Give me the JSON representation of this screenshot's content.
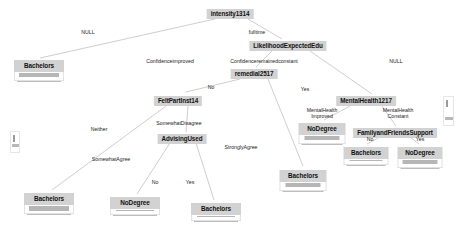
{
  "plot": {
    "type": "decision-tree",
    "background": "#ffffff",
    "node_fill": "#d2d2d2",
    "bar_fill": "#b6b6b6",
    "edge_color": "#b9b9b9",
    "width": 464,
    "height": 241
  },
  "nodes": [
    {
      "id": "intensity1314",
      "label": "intensity1314",
      "x": 230,
      "y": 9,
      "kind": "inner"
    },
    {
      "id": "LikelihoodExpectedEdu",
      "label": "LikelihoodExpectedEdu",
      "x": 288,
      "y": 41,
      "kind": "inner"
    },
    {
      "id": "remedial2517",
      "label": "remedial2517",
      "x": 254,
      "y": 69,
      "kind": "inner"
    },
    {
      "id": "FeltPartInst14",
      "label": "FeltPartInst14",
      "x": 178,
      "y": 96,
      "kind": "inner"
    },
    {
      "id": "MentalHealth1217",
      "label": "MentalHealth1217",
      "x": 366,
      "y": 96,
      "kind": "inner"
    },
    {
      "id": "AdvisingUsed",
      "label": "AdvisingUsed",
      "x": 182,
      "y": 134,
      "kind": "inner"
    },
    {
      "id": "FamilyandFriendsSupport",
      "label": "FamilyandFriendsSupport",
      "x": 395,
      "y": 128,
      "kind": "inner"
    }
  ],
  "leaves": [
    {
      "id": "leaf-bachelors-1",
      "label": "Bachelors",
      "x": 39,
      "y": 60,
      "width": 50,
      "bar_height": 4.4,
      "bar_width": 0.95
    },
    {
      "id": "leaf-nodegree-1",
      "label": "NoDegree",
      "x": 322,
      "y": 123,
      "width": 47,
      "bar_height": 4.4,
      "bar_width": 0.92
    },
    {
      "id": "leaf-bachelors-2",
      "label": "Bachelors",
      "x": 366,
      "y": 147,
      "width": 45,
      "bar_height": 1.2,
      "bar_width": 0.9
    },
    {
      "id": "leaf-nodegree-2",
      "label": "NoDegree",
      "x": 420,
      "y": 147,
      "width": 45,
      "bar_height": 4.4,
      "bar_width": 0.92
    },
    {
      "id": "leaf-bachelors-3",
      "label": "Bachelors",
      "x": 49,
      "y": 193,
      "width": 50,
      "bar_height": 4.6,
      "bar_width": 0.94
    },
    {
      "id": "leaf-nodegree-3",
      "label": "NoDegree",
      "x": 135,
      "y": 197,
      "width": 50,
      "bar_height": 1.2,
      "bar_width": 0.92
    },
    {
      "id": "leaf-bachelors-4",
      "label": "Bachelors",
      "x": 216,
      "y": 203,
      "width": 50,
      "bar_height": 1.2,
      "bar_width": 0.92
    },
    {
      "id": "leaf-bachelors-5",
      "label": "Bachelors",
      "x": 303,
      "y": 170,
      "width": 47,
      "bar_height": 4.4,
      "bar_width": 0.92
    }
  ],
  "edge_labels": [
    {
      "id": "edge-null-left",
      "text": "NULL",
      "x": 88,
      "y": 33
    },
    {
      "id": "edge-fulltime",
      "text": "fulltime",
      "x": 257,
      "y": 33
    },
    {
      "id": "edge-conf-improved",
      "text": "Confidenceimproved",
      "x": 170,
      "y": 62
    },
    {
      "id": "edge-conf-constant",
      "text": "Confidenceremainedconstant",
      "x": 264,
      "y": 62
    },
    {
      "id": "edge-null-right",
      "text": "NULL",
      "x": 396,
      "y": 62
    },
    {
      "id": "edge-no-1",
      "text": "No",
      "x": 211,
      "y": 88
    },
    {
      "id": "edge-yes-1",
      "text": "Yes",
      "x": 305,
      "y": 90
    },
    {
      "id": "edge-neither",
      "text": "Neither",
      "x": 99,
      "y": 130
    },
    {
      "id": "edge-somewhat-disag",
      "text": "SomewhatDisagree",
      "x": 179,
      "y": 124
    },
    {
      "id": "edge-mh-improved",
      "text": "MentalHealth\nImproved",
      "x": 322,
      "y": 114
    },
    {
      "id": "edge-mh-constant",
      "text": "MentalHealth\nConstant",
      "x": 398,
      "y": 114
    },
    {
      "id": "edge-somewhat-agree",
      "text": "SomewhatAgree",
      "x": 111,
      "y": 160
    },
    {
      "id": "edge-strongly-agree",
      "text": "StronglyAgree",
      "x": 241,
      "y": 148
    },
    {
      "id": "edge-no-2",
      "text": "No",
      "x": 155,
      "y": 183
    },
    {
      "id": "edge-yes-2",
      "text": "Yes",
      "x": 190,
      "y": 183
    },
    {
      "id": "edge-no-3",
      "text": "No",
      "x": 370,
      "y": 140
    },
    {
      "id": "edge-yes-3",
      "text": "Yes",
      "x": 420,
      "y": 140
    }
  ],
  "edges": [
    {
      "id": "e-root-left",
      "from": "intensity1314",
      "to": "leaf-bachelors-1",
      "x1": 215,
      "y1": 19,
      "x2": 40,
      "y2": 58
    },
    {
      "id": "e-root-right",
      "from": "intensity1314",
      "to": "LikelihoodExpectedEdu",
      "x1": 248,
      "y1": 19,
      "x2": 282,
      "y2": 39
    },
    {
      "id": "e-like-left",
      "from": "LikelihoodExpectedEdu",
      "to": "remedial2517",
      "x1": 272,
      "y1": 51,
      "x2": 256,
      "y2": 67
    },
    {
      "id": "e-like-right",
      "from": "LikelihoodExpectedEdu",
      "to": "MentalHealth1217",
      "x1": 310,
      "y1": 51,
      "x2": 372,
      "y2": 94
    },
    {
      "id": "e-rem-left",
      "from": "remedial2517",
      "to": "FeltPartInst14",
      "x1": 240,
      "y1": 79,
      "x2": 186,
      "y2": 92
    },
    {
      "id": "e-rem-right",
      "from": "remedial2517",
      "to": "leaf-bachelors-5",
      "x1": 268,
      "y1": 79,
      "x2": 303,
      "y2": 166
    },
    {
      "id": "e-felt-left",
      "from": "FeltPartInst14",
      "to": "leaf-bachelors-3",
      "x1": 166,
      "y1": 106,
      "x2": 52,
      "y2": 190
    },
    {
      "id": "e-felt-right",
      "from": "FeltPartInst14",
      "to": "AdvisingUsed",
      "x1": 188,
      "y1": 106,
      "x2": 186,
      "y2": 132
    },
    {
      "id": "e-adv-left",
      "from": "AdvisingUsed",
      "to": "leaf-nodegree-3",
      "x1": 170,
      "y1": 143,
      "x2": 137,
      "y2": 194
    },
    {
      "id": "e-adv-right",
      "from": "AdvisingUsed",
      "to": "leaf-bachelors-4",
      "x1": 196,
      "y1": 143,
      "x2": 214,
      "y2": 200
    },
    {
      "id": "e-mh-left",
      "from": "MentalHealth1217",
      "to": "leaf-nodegree-1",
      "x1": 350,
      "y1": 106,
      "x2": 324,
      "y2": 120
    },
    {
      "id": "e-mh-right",
      "from": "MentalHealth1217",
      "to": "FamilyandFriendsSupport",
      "x1": 382,
      "y1": 106,
      "x2": 396,
      "y2": 126
    },
    {
      "id": "e-fam-left",
      "from": "FamilyandFriendsSupport",
      "to": "leaf-bachelors-2",
      "x1": 380,
      "y1": 137,
      "x2": 367,
      "y2": 144
    },
    {
      "id": "e-fam-right",
      "from": "FamilyandFriendsSupport",
      "to": "leaf-nodegree-2",
      "x1": 410,
      "y1": 137,
      "x2": 419,
      "y2": 144
    }
  ],
  "clipped_nodes": [
    {
      "id": "clip-left",
      "x": 10,
      "y": 131,
      "width": 10,
      "height": 22
    },
    {
      "id": "clip-right",
      "x": 443,
      "y": 96,
      "width": 11,
      "height": 30
    }
  ]
}
